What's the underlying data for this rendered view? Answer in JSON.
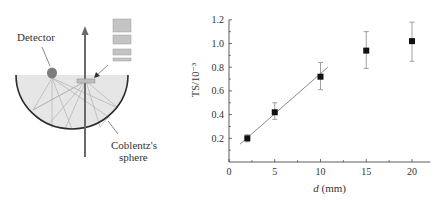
{
  "diagram": {
    "labels": {
      "detector": "Detector",
      "sphere_line1": "Coblentz's",
      "sphere_line2": "sphere"
    },
    "colors": {
      "sphere_fill": "#e6e6e6",
      "sphere_outline": "#2b2b2b",
      "beam": "#6a6a6a",
      "rays": "#b5b5b5",
      "sample_fill": "#bdbdbd",
      "detector": "#7d7d7d",
      "stack_fill": "#c4c4c4"
    }
  },
  "chart_data": {
    "type": "scatter",
    "title": "",
    "xlabel": "d (mm)",
    "xlabel_italic": "d",
    "xlabel_unit": " (mm)",
    "ylabel": "TS/10⁻³",
    "xlim": [
      0,
      22
    ],
    "ylim": [
      0,
      1.2
    ],
    "xticks": [
      0,
      5,
      10,
      15,
      20
    ],
    "yticks": [
      0.2,
      0.4,
      0.6,
      0.8,
      1.0,
      1.2
    ],
    "ytick_labels": [
      "0.2",
      "0.4",
      "0.6",
      "0.8",
      "1.0",
      "1.2"
    ],
    "xtick_labels": [
      "0",
      "5",
      "10",
      "15",
      "20"
    ],
    "grid": false,
    "legend": null,
    "series": [
      {
        "name": "measured TS",
        "marker": "square",
        "x": [
          2,
          5,
          10,
          15,
          20
        ],
        "y": [
          0.2,
          0.42,
          0.72,
          0.94,
          1.02
        ],
        "err_low": [
          0.17,
          0.36,
          0.61,
          0.79,
          0.85
        ],
        "err_high": [
          0.23,
          0.5,
          0.84,
          1.1,
          1.18
        ]
      }
    ],
    "fit_line": {
      "x": [
        1.2,
        10.8
      ],
      "y": [
        0.15,
        0.8
      ],
      "color": "#8a8a8a"
    }
  }
}
